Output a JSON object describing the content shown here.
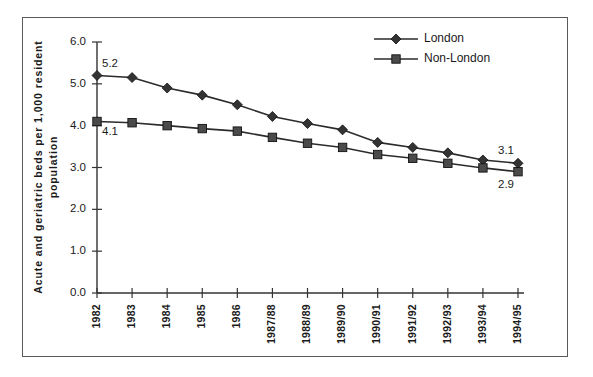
{
  "chart_data": {
    "type": "line",
    "title": "",
    "xlabel": "",
    "ylabel": "Acute and geriatric beds per 1,000 resident population",
    "ylabel_line1": "Acute and geriatric beds per 1,000 resident",
    "ylabel_line2": "population",
    "categories": [
      "1982",
      "1983",
      "1984",
      "1985",
      "1986",
      "1987/88",
      "1988/89",
      "1989/90",
      "1990/91",
      "1991/92",
      "1992/93",
      "1993/94",
      "1994/95"
    ],
    "ylim": [
      0.0,
      6.0
    ],
    "ytick_labels": [
      "0.0",
      "1.0",
      "2.0",
      "3.0",
      "4.0",
      "5.0",
      "6.0"
    ],
    "ytick_values": [
      0.0,
      1.0,
      2.0,
      3.0,
      4.0,
      5.0,
      6.0
    ],
    "grid": false,
    "legend_position": "top-right",
    "series": [
      {
        "name": "London",
        "marker": "diamond",
        "color": "#333333",
        "values": [
          5.2,
          5.15,
          4.9,
          4.73,
          4.5,
          4.22,
          4.05,
          3.9,
          3.6,
          3.48,
          3.35,
          3.18,
          3.1
        ]
      },
      {
        "name": "Non-London",
        "marker": "square",
        "color": "#4a4a4a",
        "values": [
          4.1,
          4.07,
          4.0,
          3.93,
          3.87,
          3.72,
          3.58,
          3.48,
          3.31,
          3.22,
          3.1,
          2.99,
          2.9
        ]
      }
    ],
    "annotations": [
      {
        "text": "5.2",
        "series": "London",
        "category": "1982",
        "value": 5.2,
        "position": "above-right"
      },
      {
        "text": "4.1",
        "series": "Non-London",
        "category": "1982",
        "value": 4.1,
        "position": "below-right"
      },
      {
        "text": "3.1",
        "series": "London",
        "category": "1994/95",
        "value": 3.1,
        "position": "above-left"
      },
      {
        "text": "2.9",
        "series": "Non-London",
        "category": "1994/95",
        "value": 2.9,
        "position": "below-left"
      }
    ]
  },
  "legend": {
    "items": [
      {
        "label": "London",
        "marker": "diamond"
      },
      {
        "label": "Non-London",
        "marker": "square"
      }
    ]
  },
  "colors": {
    "line": "#2b2b2b",
    "axis": "#333333",
    "frame": "#5a5a5a",
    "text": "#1a1a1a",
    "background": "#ffffff"
  }
}
